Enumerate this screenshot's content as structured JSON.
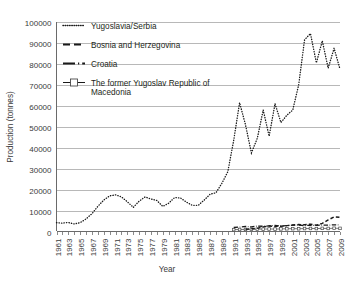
{
  "chart_data": {
    "type": "line",
    "title": "",
    "xlabel": "Year",
    "ylabel": "Production (tonnes)",
    "xlim": [
      1961,
      2009
    ],
    "ylim": [
      0,
      100000
    ],
    "ytick_step": 10000,
    "grid": true,
    "legend_position": "top-left-inside",
    "yticks": [
      "100000",
      "90000",
      "80000",
      "70000",
      "60000",
      "50000",
      "40000",
      "30000",
      "20000",
      "10000",
      "0"
    ],
    "xticks": [
      "1961",
      "1963",
      "1965",
      "1967",
      "1969",
      "1971",
      "1973",
      "1975",
      "1977",
      "1979",
      "1981",
      "1983",
      "1985",
      "1987",
      "1989",
      "1991",
      "1993",
      "1995",
      "1997",
      "1999",
      "2001",
      "2003",
      "2005",
      "2007",
      "2009"
    ],
    "x": [
      1961,
      1962,
      1963,
      1964,
      1965,
      1966,
      1967,
      1968,
      1969,
      1970,
      1971,
      1972,
      1973,
      1974,
      1975,
      1976,
      1977,
      1978,
      1979,
      1980,
      1981,
      1982,
      1983,
      1984,
      1985,
      1986,
      1987,
      1988,
      1989,
      1990,
      1991,
      1992,
      1993,
      1994,
      1995,
      1996,
      1997,
      1998,
      1999,
      2000,
      2001,
      2002,
      2003,
      2004,
      2005,
      2006,
      2007,
      2008,
      2009
    ],
    "series": [
      {
        "name": "Yugoslavia/Serbia",
        "marker": "dotted",
        "color": "#1a1a1a",
        "values": [
          4200,
          4000,
          4300,
          3600,
          4200,
          6000,
          8500,
          12000,
          15000,
          17000,
          17500,
          16500,
          14200,
          11500,
          14500,
          16500,
          15500,
          14800,
          12000,
          13500,
          16200,
          16000,
          14000,
          12500,
          12500,
          15000,
          17800,
          18500,
          23000,
          28500,
          43500,
          61500,
          51000,
          37500,
          44500,
          58000,
          45500,
          61000,
          52000,
          55500,
          58000,
          70000,
          91500,
          94500,
          80500,
          91000,
          78000,
          87500,
          77500
        ]
      },
      {
        "name": "Bosnia and Herzegovina",
        "marker": "dashed",
        "color": "#1a1a1a",
        "values": [
          null,
          null,
          null,
          null,
          null,
          null,
          null,
          null,
          null,
          null,
          null,
          null,
          null,
          null,
          null,
          null,
          null,
          null,
          null,
          null,
          null,
          null,
          null,
          null,
          null,
          null,
          null,
          null,
          null,
          null,
          null,
          null,
          1100,
          1300,
          1500,
          2200,
          2600,
          2400,
          2500,
          2800,
          3100,
          3300,
          3200,
          3500,
          3000,
          3900,
          5500,
          7000,
          6800
        ]
      },
      {
        "name": "Croatia",
        "marker": "dash-dot",
        "color": "#1a1a1a",
        "values": [
          null,
          null,
          null,
          null,
          null,
          null,
          null,
          null,
          null,
          null,
          null,
          null,
          null,
          null,
          null,
          null,
          null,
          null,
          null,
          null,
          null,
          null,
          null,
          null,
          null,
          null,
          null,
          null,
          null,
          null,
          1900,
          2100,
          2400,
          2200,
          2600,
          2500,
          2700,
          2900,
          2600,
          2800,
          3000,
          3100,
          2800,
          3000,
          2900,
          3100,
          3000,
          3200,
          3100
        ]
      },
      {
        "name": "The former Yugoslav Republic of Macedonia",
        "marker": "square-line",
        "color": "#5d5d5d",
        "values": [
          null,
          null,
          null,
          null,
          null,
          null,
          null,
          null,
          null,
          null,
          null,
          null,
          null,
          null,
          null,
          null,
          null,
          null,
          null,
          null,
          null,
          null,
          null,
          null,
          null,
          null,
          null,
          null,
          null,
          null,
          900,
          950,
          1000,
          1050,
          1100,
          1150,
          1200,
          1150,
          1250,
          1300,
          1350,
          1300,
          1400,
          1450,
          1400,
          1500,
          1450,
          1550,
          1500
        ]
      }
    ]
  },
  "legend": {
    "items": [
      {
        "label": "Yugoslavia/Serbia"
      },
      {
        "label": "Bosnia and Herzegovina"
      },
      {
        "label": "Croatia"
      },
      {
        "label": "The former Yugoslav Republic of"
      },
      {
        "label": "Macedonia"
      }
    ]
  }
}
